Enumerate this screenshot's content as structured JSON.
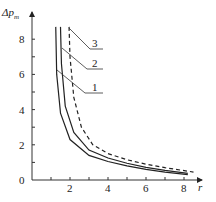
{
  "chart_data": {
    "type": "line",
    "title": "",
    "xlabel": "r",
    "ylabel": "Δp_m",
    "xlim": [
      0,
      9
    ],
    "ylim": [
      0,
      9
    ],
    "xticks": [
      2,
      4,
      6,
      8
    ],
    "yticks": [
      0,
      2,
      4,
      6,
      8
    ],
    "grid": false,
    "series": [
      {
        "name": "1",
        "style": "solid",
        "x": [
          1.25,
          1.3,
          1.5,
          2,
          3,
          4,
          5,
          6,
          7,
          8.2
        ],
        "y": [
          8.7,
          6.0,
          3.8,
          2.3,
          1.4,
          1.05,
          0.8,
          0.6,
          0.45,
          0.3
        ]
      },
      {
        "name": "2",
        "style": "solid",
        "x": [
          1.5,
          1.55,
          1.75,
          2.2,
          3,
          4,
          5,
          6,
          7,
          8.2
        ],
        "y": [
          8.7,
          6.6,
          4.2,
          2.7,
          1.7,
          1.25,
          0.95,
          0.72,
          0.55,
          0.38
        ]
      },
      {
        "name": "3",
        "style": "dashed",
        "x": [
          1.95,
          2.0,
          2.2,
          2.6,
          3.2,
          4,
          5,
          6,
          7,
          8.5
        ],
        "y": [
          8.7,
          7.0,
          4.7,
          3.0,
          2.0,
          1.5,
          1.15,
          0.9,
          0.7,
          0.45
        ]
      }
    ],
    "labels": [
      "1",
      "2",
      "3"
    ]
  }
}
